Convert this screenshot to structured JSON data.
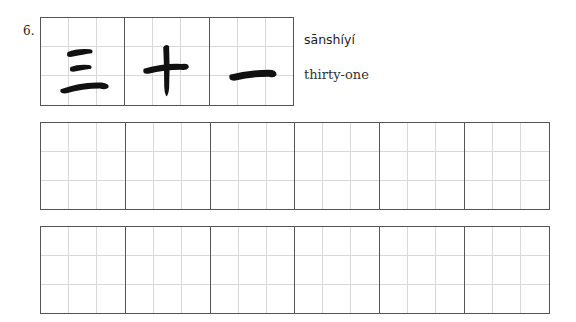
{
  "exercise": {
    "number": "6.",
    "characters": [
      {
        "char": "三",
        "icon": "san-character-icon"
      },
      {
        "char": "十",
        "icon": "shi-character-icon"
      },
      {
        "char": "一",
        "icon": "yi-character-icon"
      }
    ],
    "pinyin": "sānshíyí",
    "meaning": "thirty-one"
  },
  "practice": {
    "rows": 2,
    "cells_per_row": 6
  },
  "colors": {
    "ink": "#111111",
    "border": "#555555",
    "guide": "#d8d8d8"
  }
}
